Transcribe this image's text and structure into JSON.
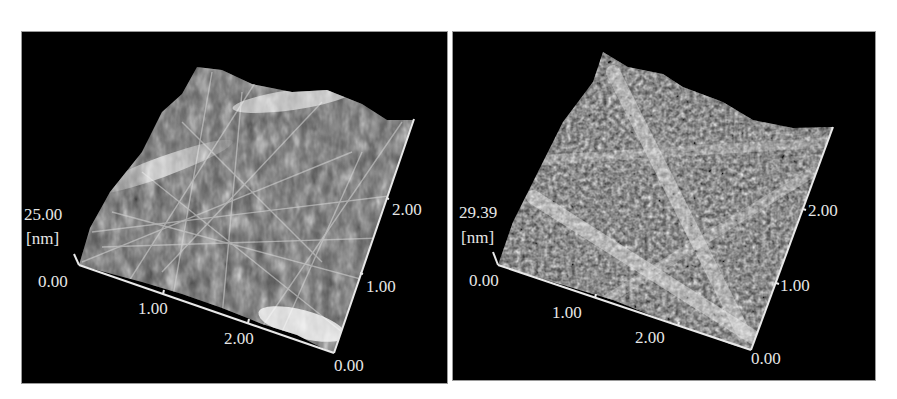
{
  "panels": [
    {
      "id": "left",
      "description": "3D AFM topography - fibrous network",
      "z_max": "25.00",
      "z_unit": "[nm]",
      "z_min": "0.00",
      "x_ticks": [
        "1.00",
        "2.00"
      ],
      "y_ticks": [
        "1.00",
        "2.00"
      ],
      "corner_origin": "0.00",
      "corner_end": "0.00"
    },
    {
      "id": "right",
      "description": "3D AFM topography - granular surface with crossing ridges",
      "z_max": "29.39",
      "z_unit": "[nm]",
      "z_min": "0.00",
      "x_ticks": [
        "1.00",
        "2.00"
      ],
      "y_ticks": [
        "1.00",
        "2.00"
      ],
      "corner_origin": "0.00",
      "corner_end": "0.00"
    }
  ],
  "colors": {
    "background": "#ffffff",
    "panel_bg": "#000000",
    "axis_line": "#e8e8e8",
    "label_text": "#e6e6e6"
  }
}
